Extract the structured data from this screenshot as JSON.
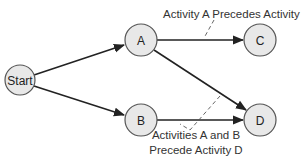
{
  "diagram": {
    "type": "activity-precedence-network",
    "nodes": [
      {
        "id": "start",
        "label": "Start",
        "cx": 20,
        "cy": 80,
        "r": 15
      },
      {
        "id": "a",
        "label": "A",
        "cx": 141,
        "cy": 40,
        "r": 16
      },
      {
        "id": "b",
        "label": "B",
        "cx": 141,
        "cy": 120,
        "r": 16
      },
      {
        "id": "c",
        "label": "C",
        "cx": 260,
        "cy": 40,
        "r": 16
      },
      {
        "id": "d",
        "label": "D",
        "cx": 260,
        "cy": 120,
        "r": 16
      }
    ],
    "edges": [
      {
        "from": "start",
        "to": "a"
      },
      {
        "from": "start",
        "to": "b"
      },
      {
        "from": "a",
        "to": "c"
      },
      {
        "from": "a",
        "to": "d"
      },
      {
        "from": "b",
        "to": "d"
      }
    ],
    "annotations": [
      {
        "id": "note-a-c",
        "lines": [
          "Activity A Precedes Activity C"
        ]
      },
      {
        "id": "note-ab-d",
        "lines": [
          "Activities A and B",
          "Precede Activity D"
        ]
      }
    ],
    "colors": {
      "node_fill": "#e8e8e8",
      "node_stroke": "#555555",
      "edge": "#222222",
      "text": "#333333"
    }
  }
}
